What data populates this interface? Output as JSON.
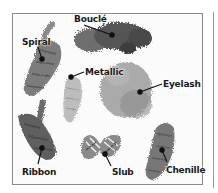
{
  "figure": {
    "labels": [
      {
        "id": "boucle",
        "text": "Bouclé",
        "x": 74,
        "y": 14
      },
      {
        "id": "spiral",
        "text": "Spiral",
        "x": 22,
        "y": 37
      },
      {
        "id": "metallic",
        "text": "Metallic",
        "x": 84,
        "y": 67
      },
      {
        "id": "eyelash",
        "text": "Eyelash",
        "x": 163,
        "y": 79
      },
      {
        "id": "ribbon",
        "text": "Ribbon",
        "x": 22,
        "y": 167
      },
      {
        "id": "slub",
        "text": "Slub",
        "x": 113,
        "y": 167
      },
      {
        "id": "chenille",
        "text": "Chenille",
        "x": 168,
        "y": 165
      }
    ],
    "colors": {
      "frame_border": "#8a8a8a",
      "label_text": "#1a1a1a",
      "yarn_dark": "#4a4a4a",
      "yarn_mid": "#7a7a7a",
      "yarn_light": "#b5b5b5"
    }
  }
}
